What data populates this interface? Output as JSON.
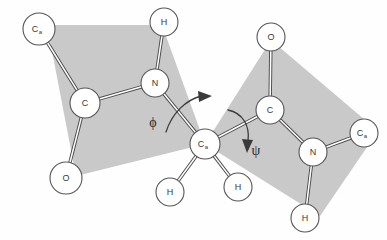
{
  "figure": {
    "width": 387,
    "height": 240,
    "background_color": "#ffffff",
    "plane_fill_color": "#c9c9c9",
    "bond_color": "#4a4a4a",
    "atom_fill_color": "#ffffff",
    "atom_stroke_color": "#555555"
  },
  "atoms": [
    {
      "id": "ca_left",
      "label": "C",
      "subscript": "a",
      "x": 39,
      "y": 29,
      "r": 16
    },
    {
      "id": "c_left",
      "label": "C",
      "subscript": "",
      "x": 85,
      "y": 103,
      "r": 15
    },
    {
      "id": "o_left",
      "label": "O",
      "subscript": "",
      "x": 66,
      "y": 178,
      "r": 16
    },
    {
      "id": "n_left",
      "label": "N",
      "subscript": "",
      "x": 155,
      "y": 83,
      "r": 14
    },
    {
      "id": "h_topleft",
      "label": "H",
      "subscript": "",
      "x": 164,
      "y": 22,
      "r": 14
    },
    {
      "id": "ca_center",
      "label": "C",
      "subscript": "a",
      "x": 205,
      "y": 144,
      "r": 15
    },
    {
      "id": "h_bl",
      "label": "H",
      "subscript": "",
      "x": 170,
      "y": 192,
      "r": 14
    },
    {
      "id": "h_bc",
      "label": "H",
      "subscript": "",
      "x": 238,
      "y": 187,
      "r": 14
    },
    {
      "id": "c_right",
      "label": "C",
      "subscript": "",
      "x": 270,
      "y": 110,
      "r": 14
    },
    {
      "id": "o_right",
      "label": "O",
      "subscript": "",
      "x": 271,
      "y": 37,
      "r": 14
    },
    {
      "id": "n_right",
      "label": "N",
      "subscript": "",
      "x": 313,
      "y": 152,
      "r": 14
    },
    {
      "id": "ca_right",
      "label": "C",
      "subscript": "a",
      "x": 364,
      "y": 133,
      "r": 14
    },
    {
      "id": "h_bottomright",
      "label": "H",
      "subscript": "",
      "x": 305,
      "y": 218,
      "r": 14
    }
  ],
  "bonds": [
    {
      "from": "ca_left",
      "to": "c_left"
    },
    {
      "from": "c_left",
      "to": "o_left"
    },
    {
      "from": "c_left",
      "to": "n_left"
    },
    {
      "from": "n_left",
      "to": "h_topleft"
    },
    {
      "from": "n_left",
      "to": "ca_center"
    },
    {
      "from": "ca_center",
      "to": "h_bl"
    },
    {
      "from": "ca_center",
      "to": "h_bc"
    },
    {
      "from": "ca_center",
      "to": "c_right"
    },
    {
      "from": "c_right",
      "to": "o_right"
    },
    {
      "from": "c_right",
      "to": "n_right"
    },
    {
      "from": "n_right",
      "to": "ca_right"
    },
    {
      "from": "n_right",
      "to": "h_bottomright"
    }
  ],
  "planes": [
    {
      "id": "peptide-plane-left",
      "points": "47,25 162,25 205,144 76,176"
    },
    {
      "id": "peptide-plane-right",
      "points": "271,40 378,131 320,216 205,144"
    }
  ],
  "angles": [
    {
      "id": "phi",
      "symbol": "ϕ",
      "x": 153,
      "y": 122,
      "description": "phi dihedral angle about N-Calpha bond"
    },
    {
      "id": "psi",
      "symbol": "ψ",
      "x": 256,
      "y": 150,
      "description": "psi dihedral angle about Calpha-C bond"
    }
  ],
  "rotation_arrows": [
    {
      "id": "phi-rotation-arrow",
      "direction": "clockwise-right"
    },
    {
      "id": "psi-rotation-arrow",
      "direction": "clockwise-down"
    }
  ]
}
